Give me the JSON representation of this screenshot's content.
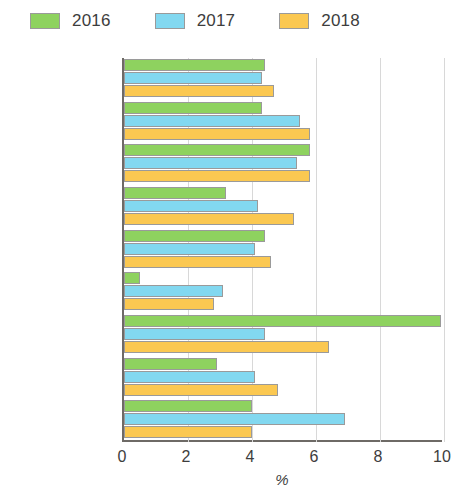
{
  "legend": {
    "items": [
      {
        "label": "2016",
        "color": "#8ed25f"
      },
      {
        "label": "2017",
        "color": "#82d8f0"
      },
      {
        "label": "2018",
        "color": "#fbc851"
      }
    ]
  },
  "axis": {
    "x_title": "%",
    "x_ticks": [
      "0",
      "2",
      "4",
      "6",
      "8",
      "10"
    ]
  },
  "chart_data": {
    "type": "bar",
    "orientation": "horizontal",
    "title": "",
    "xlabel": "%",
    "ylabel": "",
    "xlim": [
      0,
      10
    ],
    "xticks": [
      0,
      2,
      4,
      6,
      8,
      10
    ],
    "grid": true,
    "legend_position": "top-left",
    "categories": [
      "South Asia",
      "Afghanistan",
      "Bangladesh",
      "Bhutan",
      "India",
      "Maldives",
      "Nepal",
      "Pakistan",
      "Sri Lanka"
    ],
    "highlighted_categories": [
      "South Asia"
    ],
    "series": [
      {
        "name": "2016",
        "color": "#8ed25f",
        "values": [
          4.4,
          4.3,
          5.8,
          3.2,
          4.4,
          0.5,
          9.9,
          2.9,
          4.0
        ]
      },
      {
        "name": "2017",
        "color": "#82d8f0",
        "values": [
          4.3,
          5.5,
          5.4,
          4.2,
          4.1,
          3.1,
          4.4,
          4.1,
          6.9
        ]
      },
      {
        "name": "2018",
        "color": "#fbc851",
        "values": [
          4.7,
          5.8,
          5.8,
          5.3,
          4.6,
          2.8,
          6.4,
          4.8,
          4.0
        ]
      }
    ]
  }
}
